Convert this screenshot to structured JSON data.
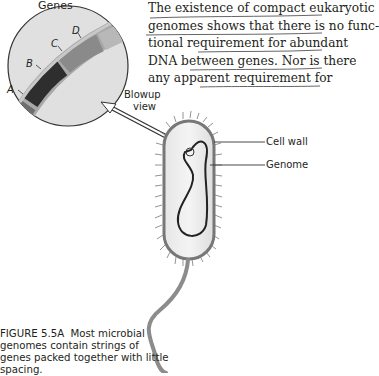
{
  "body_text": {
    "lines": [
      "The existence of compact eukaryotic",
      "genomes shows that there is no func-",
      "tional requirement for abundant",
      "DNA between genes. Nor is there",
      "any apparent requirement for"
    ]
  },
  "figure": {
    "labels": {
      "genes": "Genes",
      "gene_a": "A",
      "gene_b": "B",
      "gene_c": "C",
      "gene_d": "D",
      "blowup": "Blowup",
      "view": "view",
      "cell_wall": "Cell wall",
      "genome": "Genome"
    },
    "gene_colors": {
      "a": "#6d6d6d",
      "b": "#2e2e2e",
      "c": "#8a8a8a",
      "d": "#b4b4b4",
      "spacer": "#a0a0a0"
    },
    "caption": {
      "figure_id": "FIGURE 5.5A",
      "text": "Most microbial genomes contain strings of genes packed together with little spacing."
    }
  }
}
